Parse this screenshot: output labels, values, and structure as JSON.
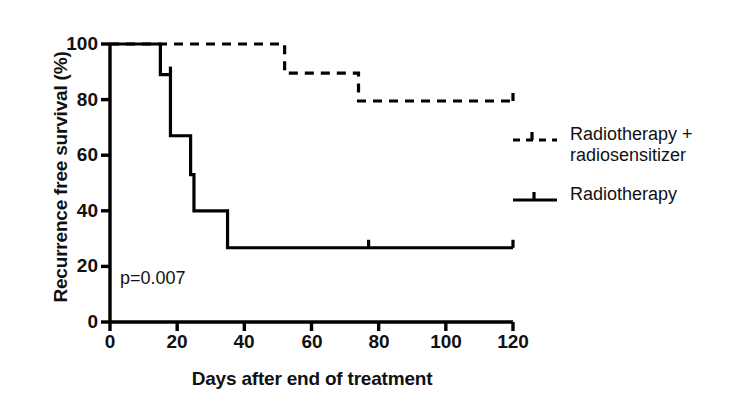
{
  "chart_data": {
    "type": "line",
    "subtype": "kaplan-meier-step",
    "title": "",
    "xlabel": "Days after end of treatment",
    "ylabel": "Recurrence free survival (%)",
    "xlim": [
      0,
      120
    ],
    "ylim": [
      0,
      100
    ],
    "xticks": [
      "0",
      "20",
      "40",
      "60",
      "80",
      "100",
      "120"
    ],
    "xtick_values": [
      0,
      20,
      40,
      60,
      80,
      100,
      120
    ],
    "yticks": [
      "0",
      "20",
      "40",
      "60",
      "80",
      "100"
    ],
    "ytick_values": [
      0,
      20,
      40,
      60,
      80,
      100
    ],
    "grid": false,
    "legend_position": "right",
    "annotations": [
      {
        "text": "p=0.007",
        "x": 3,
        "y": 19
      }
    ],
    "series": [
      {
        "name": "Radiotherapy + radiosensitizer",
        "style": "dashed",
        "color": "#000000",
        "x": [
          0,
          52,
          52,
          74,
          74,
          120
        ],
        "y": [
          100,
          100,
          89.5,
          89.5,
          79.5,
          79.5
        ],
        "censor_marks": [
          120
        ]
      },
      {
        "name": "Radiotherapy",
        "style": "solid",
        "color": "#000000",
        "x": [
          0,
          15,
          15,
          18,
          18,
          24,
          24,
          25,
          25,
          35,
          35,
          120
        ],
        "y": [
          100,
          100,
          89,
          89,
          67,
          67,
          53,
          53,
          40,
          40,
          26.7,
          26.7
        ],
        "censor_marks": [
          18,
          77,
          120
        ]
      }
    ]
  },
  "legend": {
    "items": [
      {
        "label": "Radiotherapy +\nradiosensitizer",
        "style": "dashed"
      },
      {
        "label": "Radiotherapy",
        "style": "solid"
      }
    ]
  },
  "axes": {
    "ylabel": "Recurrence free survival (%)",
    "xlabel": "Days after end of treatment"
  },
  "stats": {
    "p_value_text": "p=0.007"
  }
}
